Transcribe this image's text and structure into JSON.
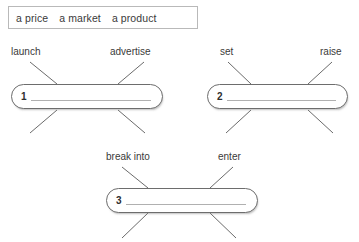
{
  "worksheet": {
    "title": "collocation matching worksheet",
    "word_bank": {
      "name": "word-bank",
      "words": [
        "a price",
        "a market",
        "a product"
      ]
    },
    "items": [
      {
        "number": "1",
        "labels": {
          "top_left": "launch",
          "top_right": "advertise",
          "bottom_left": "",
          "bottom_right": ""
        },
        "answer": ""
      },
      {
        "number": "2",
        "labels": {
          "top_left": "set",
          "top_right": "raise",
          "bottom_left": "",
          "bottom_right": ""
        },
        "answer": ""
      },
      {
        "number": "3",
        "labels": {
          "top_left": "break into",
          "top_right": "enter",
          "bottom_left": "",
          "bottom_right": ""
        },
        "answer": ""
      }
    ]
  },
  "colors": {
    "ink": "#3a3a3a",
    "bar_border": "#6d6d6d",
    "connector": "#6b6b6b",
    "write_line": "#b0b0b0",
    "bank_border": "#b9b9b9",
    "page": "#ffffff"
  }
}
